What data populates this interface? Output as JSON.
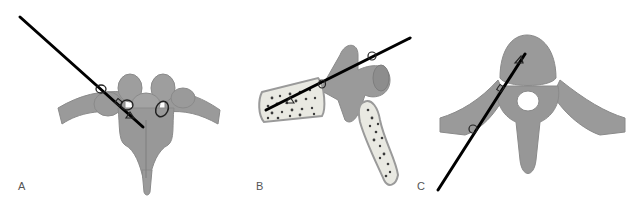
{
  "figure": {
    "panels": [
      {
        "id": "A",
        "label": "A",
        "view": "posterior view of thoracic vertebra with needle trajectory",
        "markers": [
          "oval",
          "oval",
          "square",
          "triangle",
          "oval"
        ]
      },
      {
        "id": "B",
        "label": "B",
        "view": "lateral sagittal section with needle trajectory",
        "markers": [
          "oval",
          "oval",
          "triangle"
        ]
      },
      {
        "id": "C",
        "label": "C",
        "view": "axial view of thoracic vertebra with needle trajectory",
        "markers": [
          "oval",
          "square",
          "triangle"
        ]
      }
    ],
    "colors": {
      "bone": "#9a9a9a",
      "bone_dark": "#7e7e7e",
      "bone_outline": "#8a8a8a",
      "cancellous_fill": "#e9e9e2",
      "trabeculae": "#3a3a3a",
      "needle": "#000000",
      "label_text": "#555555"
    }
  }
}
